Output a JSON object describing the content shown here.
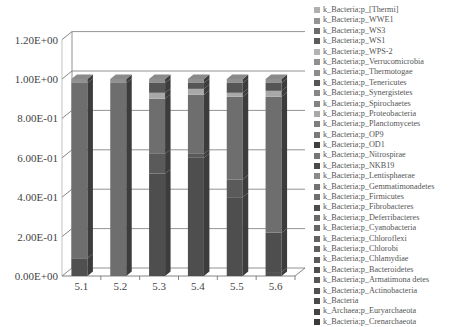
{
  "chart_data": {
    "type": "bar",
    "subtype": "stacked-3d-column",
    "title": "",
    "xlabel": "",
    "ylabel": "",
    "ylim": [
      0,
      1.2
    ],
    "yticks": [
      "0.00E+00",
      "2.00E-01",
      "4.00E-01",
      "6.00E-01",
      "8.00E-01",
      "1.00E+00",
      "1.20E+00"
    ],
    "categories": [
      "5.1",
      "5.2",
      "5.3",
      "5.4",
      "5.5",
      "5.6"
    ],
    "grid": true,
    "legend_position": "right",
    "series": [
      {
        "name": "k_Bacteria;p_Crenarchaeota",
        "color": "#3a3a3a",
        "values": [
          0.0,
          0.0,
          0.0,
          0.0,
          0.0,
          0.0
        ]
      },
      {
        "name": "k_Archaea;p_Euryarchaeota",
        "color": "#444444",
        "values": [
          0.0,
          0.0,
          0.0,
          0.0,
          0.0,
          0.0
        ]
      },
      {
        "name": "k_Bacteria",
        "color": "#4a4a4a",
        "values": [
          0.0,
          0.0,
          0.0,
          0.0,
          0.0,
          0.0
        ]
      },
      {
        "name": "k_Bacteria;p_Actinobacteria",
        "color": "#505050",
        "values": [
          0.09,
          0.0,
          0.0,
          0.0,
          0.0,
          0.02
        ]
      },
      {
        "name": "k_Bacteria;p_Armatimona detes",
        "color": "#565656",
        "values": [
          0.0,
          0.0,
          0.0,
          0.0,
          0.0,
          0.0
        ]
      },
      {
        "name": "k_Bacteria;p_Bacteroidetes",
        "color": "#4e4e4e",
        "values": [
          0.0,
          0.0,
          0.52,
          0.6,
          0.4,
          0.2
        ]
      },
      {
        "name": "k_Bacteria;p_Chlamydiae",
        "color": "#5a5a5a",
        "values": [
          0.0,
          0.0,
          0.1,
          0.02,
          0.09,
          0.0
        ]
      },
      {
        "name": "k_Bacteria;p_Chlorobi",
        "color": "#5e5e5e",
        "values": [
          0.0,
          0.0,
          0.0,
          0.0,
          0.0,
          0.0
        ]
      },
      {
        "name": "k_Bacteria;p_Chloroflexi",
        "color": "#626262",
        "values": [
          0.0,
          0.0,
          0.0,
          0.0,
          0.0,
          0.0
        ]
      },
      {
        "name": "k_Bacteria;p_Cyanobacteria",
        "color": "#666666",
        "values": [
          0.0,
          0.0,
          0.0,
          0.0,
          0.0,
          0.0
        ]
      },
      {
        "name": "k_Bacteria;p_Deferribacteres",
        "color": "#6a6a6a",
        "values": [
          0.0,
          0.0,
          0.0,
          0.0,
          0.0,
          0.0
        ]
      },
      {
        "name": "k_Bacteria;p_Fibrobacteres",
        "color": "#4c4c4c",
        "values": [
          0.0,
          0.0,
          0.0,
          0.0,
          0.0,
          0.0
        ]
      },
      {
        "name": "k_Bacteria;p_Firmicutes",
        "color": "#6e6e6e",
        "values": [
          0.89,
          0.98,
          0.28,
          0.3,
          0.42,
          0.69
        ]
      },
      {
        "name": "k_Bacteria;p_Gemmatimonadetes",
        "color": "#727272",
        "values": [
          0.0,
          0.0,
          0.0,
          0.0,
          0.0,
          0.0
        ]
      },
      {
        "name": "k_Bacteria;p_Lentisphaerae",
        "color": "#8a8a8a",
        "values": [
          0.0,
          0.0,
          0.0,
          0.0,
          0.0,
          0.0
        ]
      },
      {
        "name": "k_Bacteria;p_NKB19",
        "color": "#4a4a4a",
        "values": [
          0.0,
          0.0,
          0.0,
          0.0,
          0.0,
          0.0
        ]
      },
      {
        "name": "k_Bacteria;p_Nitrospirae",
        "color": "#767676",
        "values": [
          0.0,
          0.0,
          0.0,
          0.0,
          0.0,
          0.0
        ]
      },
      {
        "name": "k_Bacteria;p_OD1",
        "color": "#404040",
        "values": [
          0.0,
          0.0,
          0.0,
          0.0,
          0.0,
          0.0
        ]
      },
      {
        "name": "k_Bacteria;p_OP9",
        "color": "#7a7a7a",
        "values": [
          0.0,
          0.0,
          0.0,
          0.0,
          0.0,
          0.0
        ]
      },
      {
        "name": "k_Bacteria;p_Planctomycetes",
        "color": "#7e7e7e",
        "values": [
          0.0,
          0.0,
          0.0,
          0.0,
          0.0,
          0.0
        ]
      },
      {
        "name": "k_Bacteria;p_Proteobacteria",
        "color": "#a8a8a8",
        "values": [
          0.0,
          0.0,
          0.03,
          0.03,
          0.02,
          0.03
        ]
      },
      {
        "name": "k_Bacteria;p_Spirochaetes",
        "color": "#828282",
        "values": [
          0.0,
          0.0,
          0.0,
          0.0,
          0.0,
          0.0
        ]
      },
      {
        "name": "k_Bacteria;p_Synergistetes",
        "color": "#868686",
        "values": [
          0.0,
          0.0,
          0.0,
          0.0,
          0.0,
          0.0
        ]
      },
      {
        "name": "k_Bacteria;p_Tenericutes",
        "color": "#555555",
        "values": [
          0.0,
          0.0,
          0.05,
          0.03,
          0.05,
          0.04
        ]
      },
      {
        "name": "k_Bacteria;p_Thermotogae",
        "color": "#8c8c8c",
        "values": [
          0.0,
          0.0,
          0.0,
          0.0,
          0.0,
          0.0
        ]
      },
      {
        "name": "k_Bacteria;p_Verrucomicrobia",
        "color": "#909090",
        "values": [
          0.02,
          0.02,
          0.02,
          0.02,
          0.02,
          0.02
        ]
      },
      {
        "name": "k_Bacteria;p_WPS-2",
        "color": "#b4b4b4",
        "values": [
          0.0,
          0.0,
          0.0,
          0.0,
          0.0,
          0.0
        ]
      },
      {
        "name": "k_Bacteria;p_WS1",
        "color": "#5c5c5c",
        "values": [
          0.0,
          0.0,
          0.0,
          0.0,
          0.0,
          0.0
        ]
      },
      {
        "name": "k_Bacteria;p_WS3",
        "color": "#6c6c6c",
        "values": [
          0.0,
          0.0,
          0.0,
          0.0,
          0.0,
          0.0
        ]
      },
      {
        "name": "k_Bacteria;p_WWE1",
        "color": "#949494",
        "values": [
          0.0,
          0.0,
          0.0,
          0.0,
          0.0,
          0.0
        ]
      },
      {
        "name": "k_Bacteria;p_[Thermi]",
        "color": "#b0b0b0",
        "values": [
          0.0,
          0.0,
          0.0,
          0.0,
          0.0,
          0.0
        ]
      }
    ]
  },
  "legend": {
    "items": [
      "k_Bacteria;p_[Thermi]",
      "k_Bacteria;p_WWE1",
      "k_Bacteria;p_WS3",
      "k_Bacteria;p_WS1",
      "k_Bacteria;p_WPS-2",
      "k_Bacteria;p_Verrucomicrobia",
      "k_Bacteria;p_Thermotogae",
      "k_Bacteria;p_Tenericutes",
      "k_Bacteria;p_Synergistetes",
      "k_Bacteria;p_Spirochaetes",
      "k_Bacteria;p_Proteobacteria",
      "k_Bacteria;p_Planctomycetes",
      "k_Bacteria;p_OP9",
      "k_Bacteria;p_OD1",
      "k_Bacteria;p_Nitrospirae",
      "k_Bacteria;p_NKB19",
      "k_Bacteria;p_Lentisphaerae",
      "k_Bacteria;p_Gemmatimonadetes",
      "k_Bacteria;p_Firmicutes",
      "k_Bacteria;p_Fibrobacteres",
      "k_Bacteria;p_Deferribacteres",
      "k_Bacteria;p_Cyanobacteria",
      "k_Bacteria;p_Chloroflexi",
      "k_Bacteria;p_Chlorobi",
      "k_Bacteria;p_Chlamydiae",
      "k_Bacteria;p_Bacteroidetes",
      "k_Bacteria;p_Armatimona detes",
      "k_Bacteria;p_Actinobacteria",
      "k_Bacteria",
      "k_Archaea;p_Euryarchaeota",
      "k_Bacteria;p_Crenarchaeota"
    ]
  }
}
